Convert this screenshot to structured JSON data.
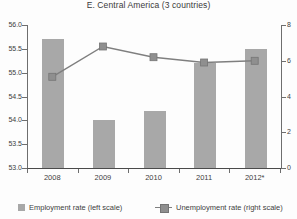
{
  "chart_data": {
    "type": "bar",
    "title": "E. Central America (3 countries)",
    "categories": [
      "2008",
      "2009",
      "2010",
      "2011",
      "2012*"
    ],
    "series": [
      {
        "name": "Employment rate (left scale)",
        "kind": "bar",
        "axis": "left",
        "values": [
          55.7,
          54.0,
          54.2,
          55.2,
          55.5
        ]
      },
      {
        "name": "Unemployment rate (right scale)",
        "kind": "line",
        "axis": "right",
        "values": [
          5.1,
          6.8,
          6.2,
          5.9,
          6.0
        ]
      }
    ],
    "left_axis": {
      "min": 53.0,
      "max": 56.0,
      "tick_labels": [
        "56.0",
        "55.5",
        "55.0",
        "54.5",
        "54.0",
        "53.5",
        "53.0"
      ]
    },
    "right_axis": {
      "min": 0,
      "max": 8,
      "tick_labels": [
        "8",
        "6",
        "4",
        "2",
        "0"
      ]
    },
    "grid": false,
    "legend_position": "bottom",
    "colors": {
      "bar": "#a8a8a8",
      "line": "#7f7f7f",
      "marker_fill": "#8f8f8f",
      "marker_stroke": "#757575",
      "axis": "#6e6e6e",
      "text": "#3d3d3d"
    }
  }
}
